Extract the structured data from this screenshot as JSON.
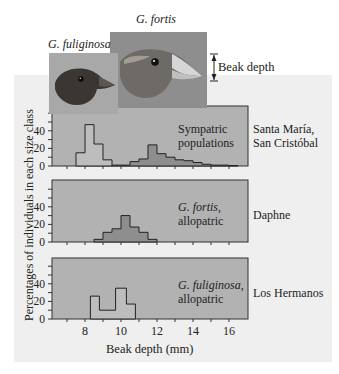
{
  "figure": {
    "species_labels": {
      "fortis": "G. fortis",
      "fuliginosa": "G. fuliginosa"
    },
    "beak_depth_label": "Beak depth",
    "y_axis_label": "Percentages of individuals in each size class",
    "x_axis_label": "Beak depth (mm)",
    "panels": [
      {
        "inner_label_line1": "Sympatric",
        "inner_label_line2": "populations",
        "inner_italic": false,
        "location_line1": "Santa María,",
        "location_line2": "San Cristóbal"
      },
      {
        "inner_label_line1": "G. fortis,",
        "inner_label_line2": "allopatric",
        "inner_italic": true,
        "location_line1": "Daphne",
        "location_line2": ""
      },
      {
        "inner_label_line1": "G. fuliginosa,",
        "inner_label_line2": "allopatric",
        "inner_italic": true,
        "location_line1": "Los Hermanos",
        "location_line2": ""
      }
    ],
    "colors": {
      "background_panel": "#efefef",
      "plot_fill": "#b2b2b2",
      "fuliginosa_bar": "#bdbdbd",
      "fortis_bar": "#8e8e8e",
      "axis": "#333333",
      "fortis_photo_bg": "#8c8c8c",
      "fuliginosa_photo_bg": "#a8a8a8"
    }
  },
  "chart_data": {
    "type": "bar",
    "title": "",
    "xlabel": "Beak depth (mm)",
    "ylabel": "Percentages of individuals in each size class",
    "x_ticks": [
      8,
      10,
      12,
      14,
      16
    ],
    "xlim": [
      6.5,
      17
    ],
    "y_ticks": [
      0,
      20,
      40
    ],
    "ylim": [
      0,
      60
    ],
    "grid": false,
    "panels": [
      {
        "name": "Santa María, San Cristóbal (Sympatric populations)",
        "series": [
          {
            "name": "G. fuliginosa",
            "bins": [
              [
                7.5,
                8.0,
                15
              ],
              [
                8.0,
                8.5,
                47
              ],
              [
                8.5,
                9.0,
                25
              ],
              [
                9.0,
                9.5,
                7
              ]
            ]
          },
          {
            "name": "G. fortis",
            "bins": [
              [
                9.5,
                10.0,
                1
              ],
              [
                10.0,
                10.5,
                1
              ],
              [
                10.5,
                11.0,
                5
              ],
              [
                11.0,
                11.5,
                8
              ],
              [
                11.5,
                12.0,
                24
              ],
              [
                12.0,
                12.5,
                14
              ],
              [
                12.5,
                13.0,
                10
              ],
              [
                13.0,
                13.5,
                7
              ],
              [
                13.5,
                14.0,
                6
              ],
              [
                14.0,
                14.5,
                4
              ],
              [
                14.5,
                15.0,
                2
              ],
              [
                15.0,
                15.5,
                1
              ],
              [
                15.5,
                16.0,
                1
              ],
              [
                16.0,
                16.5,
                0.5
              ]
            ]
          }
        ]
      },
      {
        "name": "Daphne (G. fortis, allopatric)",
        "series": [
          {
            "name": "G. fortis",
            "bins": [
              [
                8.5,
                9.0,
                3
              ],
              [
                9.0,
                9.5,
                11
              ],
              [
                9.5,
                10.0,
                15
              ],
              [
                10.0,
                10.5,
                30
              ],
              [
                10.5,
                11.0,
                17
              ],
              [
                11.0,
                11.5,
                11
              ],
              [
                11.5,
                12.0,
                3
              ]
            ]
          }
        ]
      },
      {
        "name": "Los Hermanos (G. fuliginosa, allopatric)",
        "series": [
          {
            "name": "G. fuliginosa",
            "bins": [
              [
                8.3,
                8.8,
                26
              ],
              [
                8.8,
                9.7,
                10
              ],
              [
                9.7,
                10.3,
                35
              ],
              [
                10.3,
                10.8,
                17
              ]
            ]
          }
        ]
      }
    ]
  }
}
